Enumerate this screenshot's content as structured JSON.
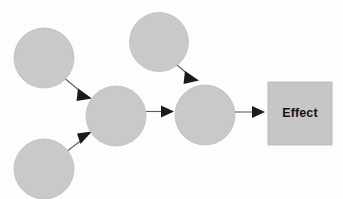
{
  "diagram": {
    "background_color": "#fdfdfd",
    "node_fill_color": "#c9c9c9",
    "node_stroke_color": "#b9b9b9",
    "box_fill_color": "#c6c6c6",
    "arrow_color": "#5d5d5d",
    "arrowhead_color": "#1b1b1b",
    "label_color": "#141414",
    "nodes": [
      {
        "id": "cause-top-left",
        "shape": "circle",
        "label": "",
        "cx": 44,
        "cy": 58,
        "r": 30
      },
      {
        "id": "cause-bottom-left",
        "shape": "circle",
        "label": "",
        "cx": 44,
        "cy": 169,
        "r": 30
      },
      {
        "id": "cause-top-center",
        "shape": "circle",
        "label": "",
        "cx": 159,
        "cy": 42,
        "r": 29.5
      },
      {
        "id": "middle-node",
        "shape": "circle",
        "label": "",
        "cx": 116,
        "cy": 116,
        "r": 30
      },
      {
        "id": "fourth-node",
        "shape": "circle",
        "label": "",
        "cx": 205,
        "cy": 115,
        "r": 30
      },
      {
        "id": "effect-box",
        "shape": "rect",
        "label": "Effect",
        "x": 268,
        "y": 82,
        "width": 64,
        "height": 63
      }
    ],
    "edges": [
      {
        "id": "edge-top-left-to-middle",
        "from": "cause-top-left",
        "to": "middle-node",
        "direction": "down-right"
      },
      {
        "id": "edge-bottom-left-to-middle",
        "from": "cause-bottom-left",
        "to": "middle-node",
        "direction": "up-right"
      },
      {
        "id": "edge-middle-to-fourth",
        "from": "middle-node",
        "to": "fourth-node",
        "direction": "right"
      },
      {
        "id": "edge-top-center-to-fourth",
        "from": "cause-top-center",
        "to": "fourth-node",
        "direction": "down-right"
      },
      {
        "id": "edge-fourth-to-effect",
        "from": "fourth-node",
        "to": "effect-box",
        "direction": "right"
      }
    ],
    "effect_label": "Effect"
  }
}
